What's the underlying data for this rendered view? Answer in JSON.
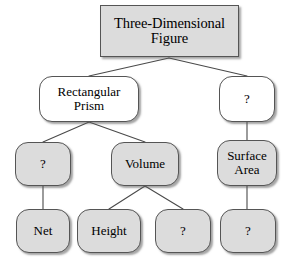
{
  "diagram": {
    "kind": "concept-map-tree",
    "title": "Three-Dimensional Figure",
    "background_color": "#ffffff",
    "edge_color": "#4a4a4a",
    "border_color": "#555555",
    "fill_white": "#ffffff",
    "fill_gray": "#dcdcdc",
    "text_color": "#000000",
    "nodes": [
      {
        "id": "root",
        "label": "Three-Dimensional\nFigure",
        "shape": "rectangle",
        "fill": "gray",
        "level": 1,
        "x": 100,
        "y": 5,
        "width": 139,
        "height": 52
      },
      {
        "id": "rectangular-prism",
        "label": "Rectangular\nPrism",
        "shape": "rounded",
        "fill": "white",
        "level": 2,
        "x": 39,
        "y": 76,
        "width": 100,
        "height": 46
      },
      {
        "id": "question-right-level2",
        "label": "?",
        "shape": "rounded",
        "fill": "white",
        "level": 2,
        "x": 219,
        "y": 76,
        "width": 56,
        "height": 46
      },
      {
        "id": "question-left-level3",
        "label": "?",
        "shape": "rounded",
        "fill": "gray",
        "level": 3,
        "x": 15,
        "y": 142,
        "width": 56,
        "height": 44
      },
      {
        "id": "volume",
        "label": "Volume",
        "shape": "rounded",
        "fill": "gray",
        "level": 3,
        "x": 111,
        "y": 142,
        "width": 68,
        "height": 44
      },
      {
        "id": "surface-area",
        "label": "Surface\nArea",
        "shape": "rounded",
        "fill": "gray",
        "level": 3,
        "x": 217,
        "y": 140,
        "width": 60,
        "height": 46
      },
      {
        "id": "net",
        "label": "Net",
        "shape": "rounded",
        "fill": "gray",
        "level": 4,
        "x": 16,
        "y": 209,
        "width": 54,
        "height": 44
      },
      {
        "id": "height",
        "label": "Height",
        "shape": "rounded",
        "fill": "gray",
        "level": 4,
        "x": 77,
        "y": 209,
        "width": 64,
        "height": 44
      },
      {
        "id": "question-volume-right",
        "label": "?",
        "shape": "rounded",
        "fill": "gray",
        "level": 4,
        "x": 155,
        "y": 209,
        "width": 56,
        "height": 44
      },
      {
        "id": "question-surface-area",
        "label": "?",
        "shape": "rounded",
        "fill": "gray",
        "level": 4,
        "x": 220,
        "y": 209,
        "width": 56,
        "height": 44
      }
    ],
    "edges": [
      {
        "id": "root-to-rectangular-prism",
        "from": "root",
        "to": "rectangular-prism",
        "x1": 169,
        "y1": 58,
        "x2": 89,
        "y2": 76
      },
      {
        "id": "root-to-question-right-level2",
        "from": "root",
        "to": "question-right-level2",
        "x1": 169,
        "y1": 58,
        "x2": 247,
        "y2": 76
      },
      {
        "id": "rectangular-prism-to-question-left",
        "from": "rectangular-prism",
        "to": "question-left-level3",
        "x1": 89,
        "y1": 122,
        "x2": 43,
        "y2": 142
      },
      {
        "id": "rectangular-prism-to-volume",
        "from": "rectangular-prism",
        "to": "volume",
        "x1": 89,
        "y1": 122,
        "x2": 145,
        "y2": 142
      },
      {
        "id": "question-right-level2-to-surface-area",
        "from": "question-right-level2",
        "to": "surface-area",
        "x1": 247,
        "y1": 122,
        "x2": 247,
        "y2": 140
      },
      {
        "id": "question-left-to-net",
        "from": "question-left-level3",
        "to": "net",
        "x1": 43,
        "y1": 186,
        "x2": 43,
        "y2": 209
      },
      {
        "id": "volume-to-height",
        "from": "volume",
        "to": "height",
        "x1": 145,
        "y1": 186,
        "x2": 109,
        "y2": 209
      },
      {
        "id": "volume-to-question",
        "from": "volume",
        "to": "question-volume-right",
        "x1": 145,
        "y1": 186,
        "x2": 183,
        "y2": 209
      },
      {
        "id": "surface-area-to-question",
        "from": "surface-area",
        "to": "question-surface-area",
        "x1": 247,
        "y1": 186,
        "x2": 247,
        "y2": 209
      }
    ]
  }
}
